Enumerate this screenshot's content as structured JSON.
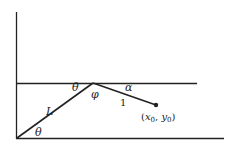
{
  "diagram": {
    "labels": {
      "theta_top": "θ",
      "phi": "φ",
      "alpha": "α",
      "L": "L",
      "one": "1",
      "theta_bottom": "θ",
      "point_x": "x",
      "point_x_sub": "0",
      "point_sep": ", ",
      "point_y": "y",
      "point_y_sub": "0",
      "paren_open": "(",
      "paren_close": ")"
    },
    "colors": {
      "stroke": "#222222",
      "background": "#ffffff"
    }
  }
}
